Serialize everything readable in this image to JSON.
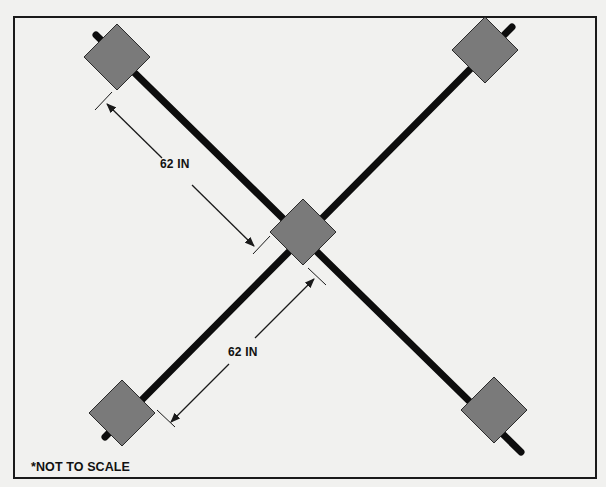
{
  "diagram": {
    "colors": {
      "background": "#f1f1ef",
      "frame": "#1a1a1a",
      "bar": "#0d0d0d",
      "diamond_fill": "#7a7a7a",
      "diamond_stroke": "#2a2a2a",
      "dimension_line": "#1a1a1a"
    },
    "frame": {
      "x": 14,
      "y": 17,
      "width": 582,
      "height": 461
    },
    "bars": [
      {
        "id": "bar-tl-br",
        "x1": 96,
        "y1": 35,
        "x2": 521,
        "y2": 452,
        "width": 7
      },
      {
        "id": "bar-bl-tr",
        "x1": 105,
        "y1": 437,
        "x2": 512,
        "y2": 27,
        "width": 7
      }
    ],
    "diamonds": [
      {
        "id": "diamond-top-left",
        "cx": 117,
        "cy": 57,
        "half": 33
      },
      {
        "id": "diamond-top-right",
        "cx": 485,
        "cy": 50,
        "half": 33
      },
      {
        "id": "diamond-center",
        "cx": 303,
        "cy": 232,
        "half": 33
      },
      {
        "id": "diamond-bottom-left",
        "cx": 122,
        "cy": 413,
        "half": 33
      },
      {
        "id": "diamond-bottom-right",
        "cx": 494,
        "cy": 410,
        "half": 33
      }
    ],
    "dimensions": [
      {
        "id": "dimension-upper",
        "label": "62 IN",
        "tick_start": {
          "x1": 95,
          "y1": 110,
          "x2": 112,
          "y2": 92
        },
        "tick_end": {
          "x1": 253,
          "y1": 254,
          "x2": 270,
          "y2": 236
        },
        "seg1": {
          "x1": 107,
          "y1": 104,
          "x2": 162,
          "y2": 158
        },
        "seg2": {
          "x1": 192,
          "y1": 185,
          "x2": 254,
          "y2": 246
        },
        "label_pos": {
          "x": 160,
          "y": 157
        }
      },
      {
        "id": "dimension-lower",
        "label": "62 IN",
        "tick_start": {
          "x1": 308,
          "y1": 268,
          "x2": 326,
          "y2": 285
        },
        "tick_end": {
          "x1": 157,
          "y1": 410,
          "x2": 175,
          "y2": 427
        },
        "seg1": {
          "x1": 314,
          "y1": 278,
          "x2": 255,
          "y2": 338
        },
        "seg2": {
          "x1": 229,
          "y1": 364,
          "x2": 171,
          "y2": 422
        },
        "label_pos": {
          "x": 228,
          "y": 345
        }
      }
    ],
    "note": "*NOT TO SCALE"
  }
}
